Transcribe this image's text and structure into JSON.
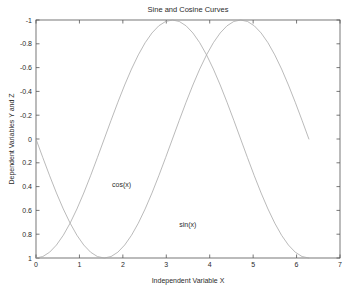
{
  "chart_data": {
    "type": "line",
    "title": "Sine and Cosine Curves",
    "xlabel": "Independent Variable X",
    "ylabel": "Dependent Variables Y and Z",
    "xlim": [
      0,
      7
    ],
    "ylim": [
      -1,
      1
    ],
    "y_axis_inverted": true,
    "grid": false,
    "legend_position": "inline-annotations",
    "xticks": [
      "0",
      "1",
      "2",
      "3",
      "4",
      "5",
      "6",
      "7"
    ],
    "xtick_values": [
      0,
      1,
      2,
      3,
      4,
      5,
      6,
      7
    ],
    "yticks": [
      "-1",
      "-0.8",
      "-0.6",
      "-0.4",
      "-0.2",
      "0",
      "0.2",
      "0.4",
      "0.6",
      "0.8",
      "1"
    ],
    "ytick_values": [
      -1,
      -0.8,
      -0.6,
      -0.4,
      -0.2,
      0,
      0.2,
      0.4,
      0.6,
      0.8,
      1
    ],
    "x_domain_of_data": [
      0,
      6.283185
    ],
    "series": [
      {
        "name": "sin(x)",
        "label": "sin(x)",
        "color": "#a8a8a8",
        "annotation": {
          "text": "sin(x)",
          "x": 3.3,
          "y": 0.72
        },
        "x": [
          0,
          0.1571,
          0.3142,
          0.4712,
          0.6283,
          0.7854,
          0.9425,
          1.0996,
          1.2566,
          1.4137,
          1.5708,
          1.7279,
          1.885,
          2.042,
          2.1991,
          2.3562,
          2.5133,
          2.6704,
          2.8274,
          2.9845,
          3.1416,
          3.2987,
          3.4558,
          3.6128,
          3.7699,
          3.927,
          4.0841,
          4.2412,
          4.3982,
          4.5553,
          4.7124,
          4.8695,
          5.0265,
          5.1836,
          5.3407,
          5.4978,
          5.6549,
          5.8119,
          5.969,
          6.1261,
          6.2832
        ],
        "y": [
          0,
          0.1564,
          0.309,
          0.454,
          0.5878,
          0.7071,
          0.809,
          0.891,
          0.9511,
          0.9877,
          1,
          0.9877,
          0.9511,
          0.891,
          0.809,
          0.7071,
          0.5878,
          0.454,
          0.309,
          0.1564,
          0,
          -0.1564,
          -0.309,
          -0.454,
          -0.5878,
          -0.7071,
          -0.809,
          -0.891,
          -0.9511,
          -0.9877,
          -1,
          -0.9877,
          -0.9511,
          -0.891,
          -0.809,
          -0.7071,
          -0.5878,
          -0.454,
          -0.309,
          -0.1564,
          0
        ]
      },
      {
        "name": "cos(x)",
        "label": "cos(x)",
        "color": "#a8a8a8",
        "annotation": {
          "text": "cos(x)",
          "x": 1.75,
          "y": 0.38
        },
        "x": [
          0,
          0.1571,
          0.3142,
          0.4712,
          0.6283,
          0.7854,
          0.9425,
          1.0996,
          1.2566,
          1.4137,
          1.5708,
          1.7279,
          1.885,
          2.042,
          2.1991,
          2.3562,
          2.5133,
          2.6704,
          2.8274,
          2.9845,
          3.1416,
          3.2987,
          3.4558,
          3.6128,
          3.7699,
          3.927,
          4.0841,
          4.2412,
          4.3982,
          4.5553,
          4.7124,
          4.8695,
          5.0265,
          5.1836,
          5.3407,
          5.4978,
          5.6549,
          5.8119,
          5.969,
          6.1261,
          6.2832
        ],
        "y": [
          1,
          0.9877,
          0.9511,
          0.891,
          0.809,
          0.7071,
          0.5878,
          0.454,
          0.309,
          0.1564,
          0,
          -0.1564,
          -0.309,
          -0.454,
          -0.5878,
          -0.7071,
          -0.809,
          -0.891,
          -0.9511,
          -0.9877,
          -1,
          -0.9877,
          -0.9511,
          -0.891,
          -0.809,
          -0.7071,
          -0.5878,
          -0.454,
          -0.309,
          -0.1564,
          0,
          0.1564,
          0.309,
          0.454,
          0.5878,
          0.7071,
          0.809,
          0.891,
          0.9511,
          0.9877,
          1
        ]
      }
    ]
  },
  "style": {
    "axis_color": "#555555",
    "text_color": "#2b2b2b",
    "background": "#ffffff",
    "curve_color": "#a8a8a8"
  }
}
